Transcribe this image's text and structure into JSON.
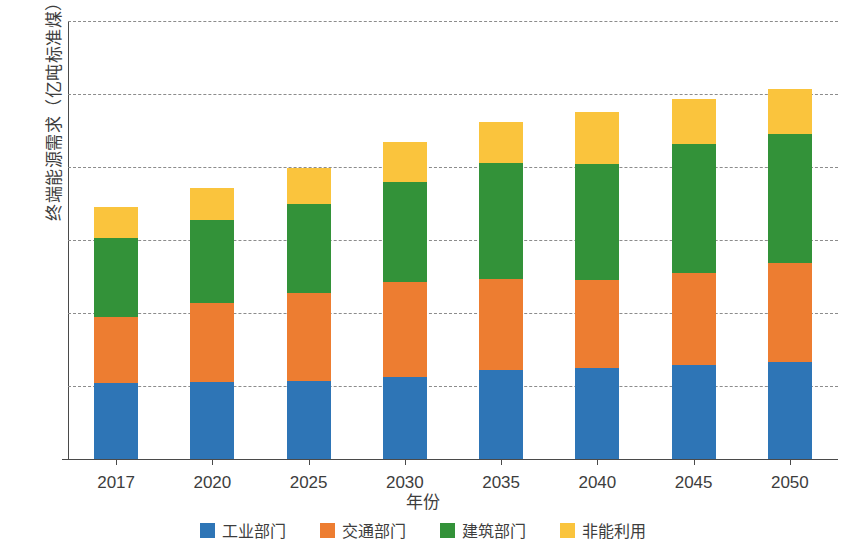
{
  "chart_data": {
    "type": "bar",
    "stacked": true,
    "title": "",
    "xlabel": "年份",
    "ylabel": "终端能源需求（亿吨标准煤）",
    "categories": [
      "2017",
      "2020",
      "2025",
      "2030",
      "2035",
      "2040",
      "2045",
      "2050"
    ],
    "ylim": [
      0,
      12
    ],
    "yticks": [
      0,
      2,
      4,
      6,
      8,
      10,
      12
    ],
    "ytick_labels": [
      "0",
      "2",
      "4",
      "6",
      "8",
      "10",
      "12"
    ],
    "grid": true,
    "grid_style": "dashed",
    "legend_position": "bottom",
    "series": [
      {
        "name": "工业部门",
        "color": "#2e75b6",
        "values": [
          2.08,
          2.1,
          2.15,
          2.25,
          2.45,
          2.5,
          2.58,
          2.66
        ]
      },
      {
        "name": "交通部门",
        "color": "#ed7d31",
        "values": [
          1.82,
          2.18,
          2.4,
          2.6,
          2.47,
          2.4,
          2.52,
          2.71
        ]
      },
      {
        "name": "建筑部门",
        "color": "#339239",
        "values": [
          2.15,
          2.27,
          2.45,
          2.75,
          3.2,
          3.18,
          3.52,
          3.53
        ]
      },
      {
        "name": "非能利用",
        "color": "#fac43d",
        "values": [
          0.85,
          0.87,
          0.97,
          1.08,
          1.12,
          1.43,
          1.23,
          1.25
        ]
      }
    ],
    "totals": [
      6.9,
      7.42,
      7.97,
      8.68,
      9.24,
      9.51,
      9.85,
      10.15
    ]
  },
  "legend": {
    "items": [
      {
        "label": "工业部门",
        "color": "#2e75b6"
      },
      {
        "label": "交通部门",
        "color": "#ed7d31"
      },
      {
        "label": "建筑部门",
        "color": "#339239"
      },
      {
        "label": "非能利用",
        "color": "#fac43d"
      }
    ]
  }
}
